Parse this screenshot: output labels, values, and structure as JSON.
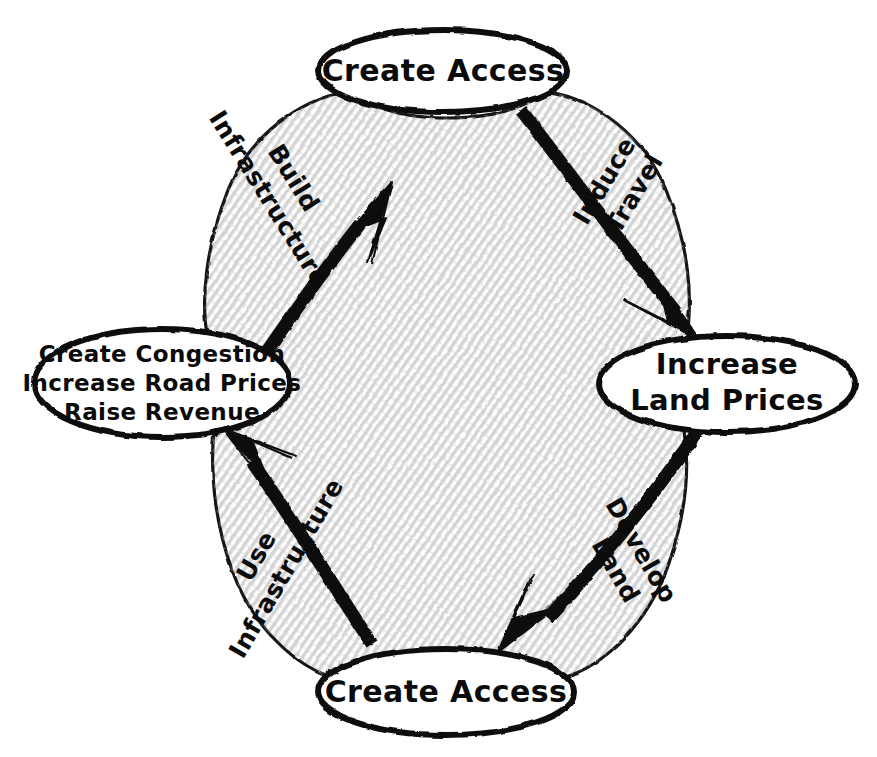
{
  "diagram": {
    "type": "cycle-diagram",
    "background_color": "#ffffff",
    "ink_color": "#111111",
    "shade_color": "#dcdcdc",
    "style": "hand-drawn sketch",
    "nodes": [
      {
        "id": "node-top",
        "position": "top",
        "lines": [
          "Create Access"
        ],
        "cx": 443,
        "cy": 71,
        "rx": 124,
        "ry": 41
      },
      {
        "id": "node-right",
        "position": "right",
        "lines": [
          "Increase",
          "Land Prices"
        ],
        "cx": 727,
        "cy": 384,
        "rx": 128,
        "ry": 48
      },
      {
        "id": "node-bottom",
        "position": "bottom",
        "lines": [
          "Create Access"
        ],
        "cx": 446,
        "cy": 692,
        "rx": 128,
        "ry": 43
      },
      {
        "id": "node-left",
        "position": "left",
        "lines": [
          "Create Congestion",
          "Increase Road Prices",
          "Raise Revenue"
        ],
        "cx": 162,
        "cy": 383,
        "rx": 128,
        "ry": 54
      }
    ],
    "edges": [
      {
        "id": "edge-induce-travel",
        "from": "node-top",
        "to": "node-right",
        "lines": [
          "Induce",
          "Travel"
        ],
        "label_x": 620,
        "label_y": 185,
        "rotation": -59
      },
      {
        "id": "edge-develop-land",
        "from": "node-right",
        "to": "node-bottom",
        "lines": [
          "Develop",
          "Land"
        ],
        "label_x": 630,
        "label_y": 562,
        "rotation": 60
      },
      {
        "id": "edge-use-infrastructure",
        "from": "node-bottom",
        "to": "node-left",
        "lines": [
          "Use",
          "Infrastructure"
        ],
        "label_x": 272,
        "label_y": 560,
        "rotation": -60
      },
      {
        "id": "edge-build-infrastructure",
        "from": "node-left",
        "to": "node-top",
        "lines": [
          "Build",
          "Infrastructure"
        ],
        "label_x": 283,
        "label_y": 190,
        "rotation": 58
      }
    ]
  }
}
